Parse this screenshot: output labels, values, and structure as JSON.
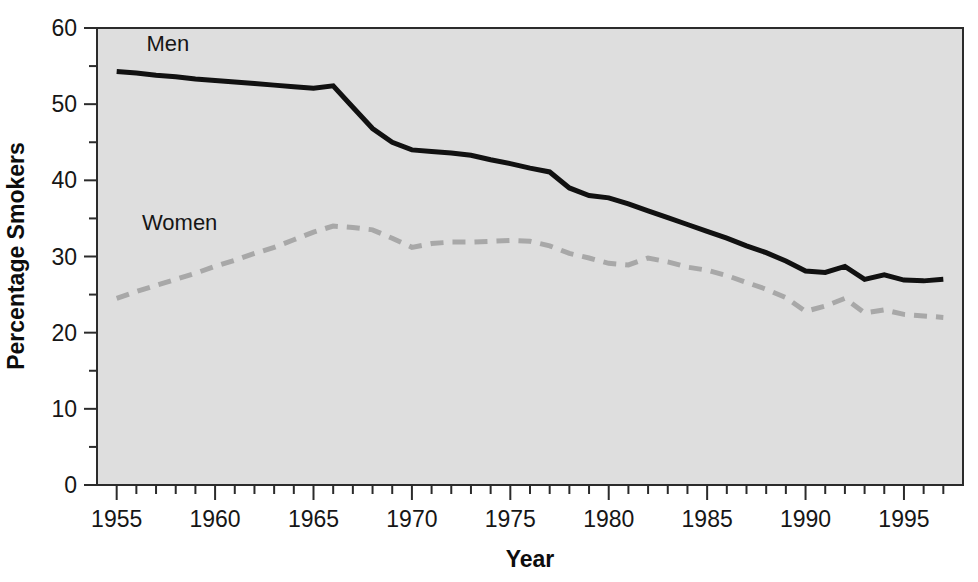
{
  "chart_data": {
    "type": "line",
    "title": "",
    "xlabel": "Year",
    "ylabel": "Percentage Smokers",
    "xlim": [
      1954,
      1998
    ],
    "ylim": [
      0,
      60
    ],
    "x_major_ticks": [
      1955,
      1960,
      1965,
      1970,
      1975,
      1980,
      1985,
      1990,
      1995
    ],
    "x_tick_labels": [
      "1955",
      "1960",
      "1965",
      "1970",
      "1975",
      "1980",
      "1985",
      "1990",
      "1995"
    ],
    "x_minor_tick_step": 1,
    "y_major_ticks": [
      0,
      10,
      20,
      30,
      40,
      50,
      60
    ],
    "y_tick_labels": [
      "0",
      "10",
      "20",
      "30",
      "40",
      "50",
      "60"
    ],
    "y_minor_ticks": [
      5,
      15,
      25,
      35,
      45,
      55
    ],
    "grid": false,
    "legend_position": "inline-annotations",
    "plot_background": "#dedede",
    "figure_background": "#ffffff",
    "series": [
      {
        "name": "Men",
        "style": "solid",
        "color": "#111111",
        "line_width": 5,
        "label_x": 1957.6,
        "label_y": 57.0,
        "x": [
          1955,
          1956,
          1957,
          1958,
          1959,
          1960,
          1961,
          1962,
          1963,
          1964,
          1965,
          1966,
          1967,
          1968,
          1969,
          1970,
          1971,
          1972,
          1973,
          1974,
          1975,
          1976,
          1977,
          1978,
          1979,
          1980,
          1981,
          1982,
          1983,
          1984,
          1985,
          1986,
          1987,
          1988,
          1989,
          1990,
          1991,
          1992,
          1993,
          1994,
          1995,
          1996,
          1997
        ],
        "values": [
          54.3,
          54.1,
          53.8,
          53.6,
          53.3,
          53.1,
          52.9,
          52.7,
          52.5,
          52.3,
          52.1,
          52.4,
          49.6,
          46.8,
          45.0,
          44.0,
          43.8,
          43.6,
          43.3,
          42.7,
          42.2,
          41.6,
          41.1,
          39.0,
          38.0,
          37.7,
          36.9,
          36.0,
          35.1,
          34.2,
          33.3,
          32.4,
          31.4,
          30.5,
          29.4,
          28.1,
          27.9,
          28.7,
          27.0,
          27.6,
          26.9,
          26.8,
          27.0
        ]
      },
      {
        "name": "Women",
        "style": "dashed",
        "color": "#a8a8a8",
        "line_width": 5,
        "label_x": 1958.2,
        "label_y": 33.5,
        "x": [
          1955,
          1956,
          1957,
          1958,
          1959,
          1960,
          1961,
          1962,
          1963,
          1964,
          1965,
          1966,
          1967,
          1968,
          1969,
          1970,
          1971,
          1972,
          1973,
          1974,
          1975,
          1976,
          1977,
          1978,
          1979,
          1980,
          1981,
          1982,
          1983,
          1984,
          1985,
          1986,
          1987,
          1988,
          1989,
          1990,
          1991,
          1992,
          1993,
          1994,
          1995,
          1996,
          1997
        ],
        "values": [
          24.5,
          25.4,
          26.2,
          27.0,
          27.8,
          28.7,
          29.5,
          30.4,
          31.2,
          32.2,
          33.2,
          34.0,
          33.8,
          33.5,
          32.4,
          31.2,
          31.7,
          31.9,
          31.9,
          32.0,
          32.1,
          32.0,
          31.4,
          30.4,
          29.8,
          29.1,
          28.9,
          29.8,
          29.3,
          28.6,
          28.2,
          27.5,
          26.6,
          25.7,
          24.6,
          22.8,
          23.5,
          24.5,
          22.6,
          23.0,
          22.4,
          22.2,
          22.0
        ]
      }
    ]
  },
  "axes": {
    "x_axis_title": "Year",
    "y_axis_title": "Percentage Smokers"
  }
}
